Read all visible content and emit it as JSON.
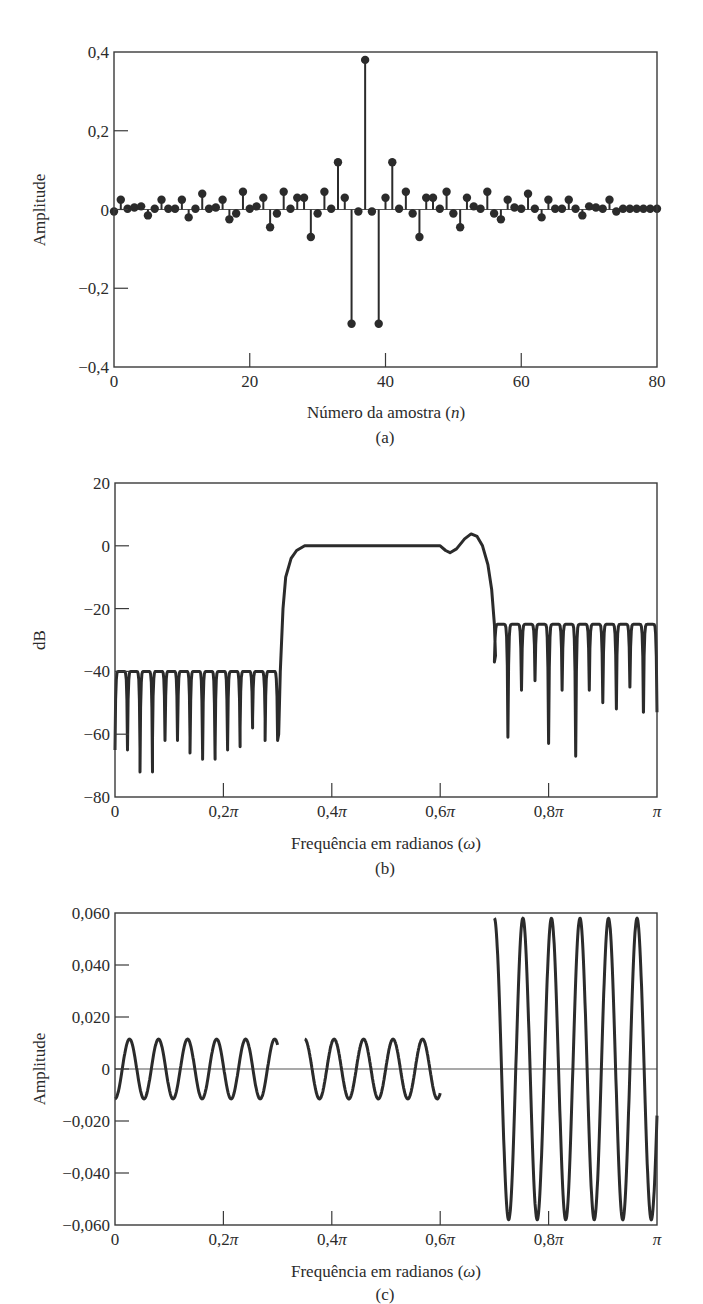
{
  "chart_data": [
    {
      "id": "a",
      "type": "stem",
      "panel_label": "(a)",
      "title": "",
      "xlabel": "Número da amostra (n)",
      "xlabel_plain": "Número da amostra (",
      "xlabel_var": "n",
      "xlabel_end": ")",
      "ylabel": "Amplitude",
      "xlim": [
        0,
        80
      ],
      "ylim": [
        -0.4,
        0.4
      ],
      "xticks": [
        0,
        20,
        40,
        60,
        80
      ],
      "xtick_labels": [
        "0",
        "20",
        "40",
        "60",
        "80"
      ],
      "yticks": [
        0.4,
        0.2,
        0,
        -0.2,
        -0.4
      ],
      "ytick_labels": [
        "0,4",
        "0,2",
        "0",
        "−0,2",
        "−0,4"
      ],
      "grid": false,
      "x": [
        0,
        1,
        2,
        3,
        4,
        5,
        6,
        7,
        8,
        9,
        10,
        11,
        12,
        13,
        14,
        15,
        16,
        17,
        18,
        19,
        20,
        21,
        22,
        23,
        24,
        25,
        26,
        27,
        28,
        29,
        30,
        31,
        32,
        33,
        34,
        35,
        36,
        37,
        38,
        39,
        40,
        41,
        42,
        43,
        44,
        45,
        46,
        47,
        48,
        49,
        50,
        51,
        52,
        53,
        54,
        55,
        56,
        57,
        58,
        59,
        60,
        61,
        62,
        63,
        64,
        65,
        66,
        67,
        68,
        69,
        70,
        71,
        72,
        73,
        74,
        75,
        76,
        77,
        78,
        79,
        80
      ],
      "values": [
        -0.005,
        0.025,
        0.002,
        0.005,
        0.008,
        -0.015,
        0.002,
        0.025,
        0.002,
        0.002,
        0.025,
        -0.02,
        0.002,
        0.04,
        0.002,
        0.005,
        0.025,
        -0.025,
        -0.01,
        0.045,
        0.002,
        0.008,
        0.03,
        -0.045,
        -0.01,
        0.045,
        0.002,
        0.03,
        0.03,
        -0.07,
        -0.01,
        0.045,
        0.002,
        0.12,
        0.03,
        -0.29,
        -0.005,
        0.38,
        -0.005,
        -0.29,
        0.03,
        0.12,
        0.002,
        0.045,
        -0.01,
        -0.07,
        0.03,
        0.03,
        0.002,
        0.045,
        -0.01,
        -0.045,
        0.03,
        0.008,
        0.002,
        0.045,
        -0.01,
        -0.025,
        0.025,
        0.005,
        0.002,
        0.04,
        0.002,
        -0.02,
        0.025,
        0.002,
        0.002,
        0.025,
        0.002,
        -0.015,
        0.008,
        0.005,
        0.002,
        0.025,
        -0.005,
        0.002,
        0.002,
        0.002,
        0.002,
        0.002,
        0.002
      ]
    },
    {
      "id": "b",
      "type": "line",
      "panel_label": "(b)",
      "title": "",
      "xlabel": "Frequência em radianos (ω)",
      "xlabel_plain": "Frequência em radianos (",
      "xlabel_var": "ω",
      "xlabel_end": ")",
      "ylabel": "dB",
      "xlim": [
        0,
        1
      ],
      "x_unit": "π",
      "ylim": [
        -80,
        20
      ],
      "xticks": [
        0,
        0.2,
        0.4,
        0.6,
        0.8,
        1.0
      ],
      "xtick_labels": [
        "0",
        "0,2π",
        "0,4π",
        "0,6π",
        "0,8π",
        "π"
      ],
      "yticks": [
        20,
        0,
        -20,
        -40,
        -60,
        -80
      ],
      "ytick_labels": [
        "20",
        "0",
        "−20",
        "−40",
        "−60",
        "−80"
      ],
      "grid": false,
      "description": "Bandpass FIR magnitude response: stopband ripple near -40 dB for 0..0.3π, passband ~0 dB 0.35π..0.6π with bump +4 dB near 0.66π, second stopband near -25 dB for 0.7π..π",
      "stopband1": {
        "range": [
          0,
          0.3
        ],
        "peak_db": -40,
        "lobes": 13,
        "null_depths": [
          -65,
          -65,
          -72,
          -62,
          -62,
          -61,
          -66,
          -68,
          -65,
          -64,
          -58,
          -55,
          -62
        ]
      },
      "passband": {
        "range": [
          0.35,
          0.6
        ],
        "level_db": 0,
        "dip": {
          "x": 0.61,
          "db": -2
        },
        "peak": {
          "x": 0.655,
          "db": 4
        }
      },
      "stopband2": {
        "range": [
          0.7,
          1.0
        ],
        "peak_db": -25,
        "lobes": 11,
        "null_depths": [
          -37,
          -61,
          -46,
          -43,
          -63,
          -46,
          -67,
          -46,
          -50,
          -52,
          -45,
          -53
        ]
      }
    },
    {
      "id": "c",
      "type": "line",
      "panel_label": "(c)",
      "title": "",
      "xlabel": "Frequência em radianos (ω)",
      "xlabel_plain": "Frequência em radianos (",
      "xlabel_var": "ω",
      "xlabel_end": ")",
      "ylabel": "Amplitude",
      "xlim": [
        0,
        1
      ],
      "x_unit": "π",
      "ylim": [
        -0.06,
        0.06
      ],
      "xticks": [
        0,
        0.2,
        0.4,
        0.6,
        0.8,
        1.0
      ],
      "xtick_labels": [
        "0",
        "0,2π",
        "0,4π",
        "0,6π",
        "0,8π",
        "π"
      ],
      "yticks": [
        0.06,
        0.04,
        0.02,
        0,
        -0.02,
        -0.04,
        -0.06
      ],
      "ytick_labels": [
        "0,060",
        "0,040",
        "0,020",
        "0",
        "−0,020",
        "−0,040",
        "−0,060"
      ],
      "grid": false,
      "zero_line": true,
      "description": "Approximation error: oscillation ±0.0115 in stopband 0..0.3π and passband 0.35π..0.6π; oscillation ±0.058 in upper band 0.7π..π",
      "segments": [
        {
          "range": [
            0,
            0.3
          ],
          "amplitude": 0.0115,
          "cycles": 5.6
        },
        {
          "range": [
            0.35,
            0.6
          ],
          "amplitude": 0.0115,
          "cycles": 4.6
        },
        {
          "range": [
            0.7,
            1.0
          ],
          "amplitude": 0.058,
          "cycles": 5.7
        }
      ]
    }
  ]
}
